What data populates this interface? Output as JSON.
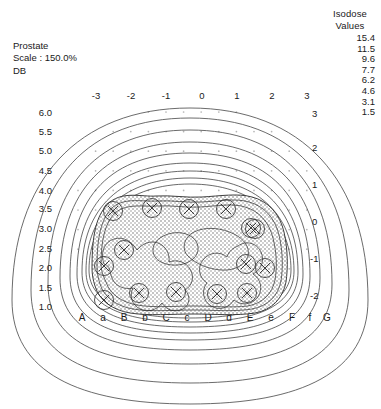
{
  "title_block": {
    "structure_label": "Prostate",
    "scale_label": "Scale : 150.0%",
    "plane_label": "DB"
  },
  "legend": {
    "heading_line1": "Isodose",
    "heading_line2": "Values",
    "values": [
      "15.4",
      "11.5",
      "9.6",
      "7.7",
      "6.2",
      "4.6",
      "3.1",
      "1.5"
    ]
  },
  "axes": {
    "top_ticks": [
      "-3",
      "-2",
      "-1",
      "0",
      "1",
      "2",
      "3"
    ],
    "left_ticks": [
      "6.0",
      "5.5",
      "5.0",
      "4.5",
      "4.0",
      "3.5",
      "3.0",
      "2.5",
      "2.0",
      "1.5",
      "1.0"
    ],
    "right_ticks": [
      "3",
      "2",
      "1",
      "0",
      "-1",
      "-2"
    ],
    "bottom_ticks": [
      "A",
      "a",
      "B",
      "b",
      "C",
      "c",
      "D",
      "d",
      "E",
      "e",
      "F",
      "f",
      "G"
    ]
  },
  "chart_data": {
    "type": "contour",
    "title": "Prostate",
    "xlabel": "",
    "ylabel": "",
    "grid": true,
    "legend_position": "top-right",
    "isodose_levels": [
      15.4,
      11.5,
      9.6,
      7.7,
      6.2,
      4.6,
      3.1,
      1.5
    ],
    "scale_percent": 150.0,
    "plane": "DB",
    "x_axis_top": {
      "ticks": [
        -3,
        -2,
        -1,
        0,
        1,
        2,
        3
      ]
    },
    "x_axis_bottom": {
      "ticks": [
        "A",
        "a",
        "B",
        "b",
        "C",
        "c",
        "D",
        "d",
        "E",
        "e",
        "F",
        "f",
        "G"
      ]
    },
    "y_axis_left": {
      "ticks": [
        6.0,
        5.5,
        5.0,
        4.5,
        4.0,
        3.5,
        3.0,
        2.5,
        2.0,
        1.5,
        1.0
      ]
    },
    "y_axis_right": {
      "ticks": [
        3,
        2,
        1,
        0,
        -1,
        -2
      ]
    },
    "seed_count": 15,
    "seed_positions_px": [
      [
        113,
        211
      ],
      [
        152,
        208
      ],
      [
        189,
        209
      ],
      [
        226,
        209
      ],
      [
        251,
        228
      ],
      [
        124,
        250
      ],
      [
        255,
        229
      ],
      [
        246,
        264
      ],
      [
        104,
        266
      ],
      [
        265,
        268
      ],
      [
        139,
        293
      ],
      [
        176,
        292
      ],
      [
        217,
        294
      ],
      [
        247,
        293
      ],
      [
        104,
        300
      ]
    ]
  }
}
